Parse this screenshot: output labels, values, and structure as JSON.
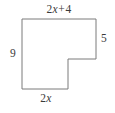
{
  "figure": {
    "kind": "l-shaped-polygon",
    "stroke_color": "#7a7a7a",
    "fill_color": "#ffffff",
    "background_color": "#ffffff",
    "text_color": "#3a3a3a",
    "stroke_width": 1,
    "vertices": [
      [
        22,
        19
      ],
      [
        96,
        19
      ],
      [
        96,
        59
      ],
      [
        68,
        59
      ],
      [
        68,
        89
      ],
      [
        22,
        89
      ]
    ],
    "labels": {
      "top": {
        "text": "2x + 4",
        "coefficient": "2",
        "variable": "x",
        "operator": "+",
        "constant": "4",
        "side": "top",
        "position": "outside-above"
      },
      "right": {
        "text": "5",
        "side": "upper-right",
        "position": "outside-right"
      },
      "left": {
        "text": "9",
        "side": "left",
        "position": "outside-left"
      },
      "bottom": {
        "text": "2x",
        "coefficient": "2",
        "variable": "x",
        "side": "bottom",
        "position": "outside-below"
      }
    }
  }
}
